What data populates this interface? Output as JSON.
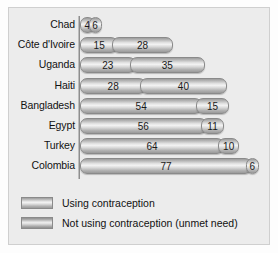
{
  "chart_data": {
    "type": "bar",
    "orientation": "horizontal",
    "stacked": true,
    "title": "",
    "xlabel": "",
    "ylabel": "",
    "categories": [
      "Chad",
      "Côte d'Ivoire",
      "Uganda",
      "Haiti",
      "Bangladesh",
      "Egypt",
      "Turkey",
      "Colombia"
    ],
    "series": [
      {
        "name": "Using contraception",
        "values": [
          4,
          15,
          23,
          28,
          54,
          56,
          64,
          77
        ]
      },
      {
        "name": "Not using contraception (unmet need)",
        "values": [
          6,
          28,
          35,
          40,
          15,
          11,
          10,
          6
        ]
      }
    ],
    "totals": [
      10,
      43,
      58,
      68,
      69,
      67,
      74,
      83
    ],
    "xlim": [
      0,
      83
    ],
    "grid": false,
    "legend_position": "bottom-left",
    "data_labels": true,
    "colors": {
      "series1": "#c9c9c9",
      "series2": "#bdbdbd",
      "panel_background": "#ececec",
      "panel_border": "#cfcfcf",
      "axis": "#8e8e8e",
      "text": "#111111"
    }
  },
  "legend": {
    "items": [
      {
        "label": "Using contraception"
      },
      {
        "label": "Not using contraception (unmet need)"
      }
    ]
  }
}
